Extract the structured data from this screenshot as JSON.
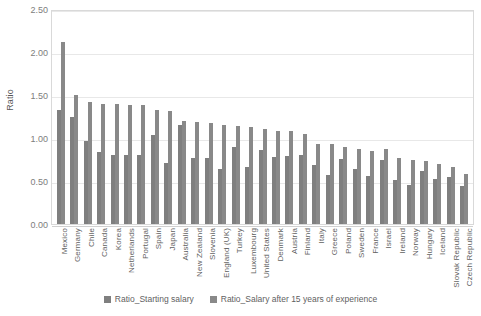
{
  "chart_data": {
    "type": "bar",
    "title": "",
    "xlabel": "",
    "ylabel": "Ratio",
    "ylim": [
      0.0,
      2.5
    ],
    "ytick_labels": [
      "0.00",
      "0.50",
      "1.00",
      "1.50",
      "2.00",
      "2.50"
    ],
    "ytick_values": [
      0.0,
      0.5,
      1.0,
      1.5,
      2.0,
      2.5
    ],
    "grid": true,
    "legend_position": "bottom",
    "categories": [
      "Mexico",
      "Germany",
      "Chile",
      "Canada",
      "Korea",
      "Netherlands",
      "Portugal",
      "Spain",
      "Japan",
      "Australia",
      "New Zealand",
      "Slovenia",
      "England (UK)",
      "Turkey",
      "Luxembourg",
      "United States",
      "Denmark",
      "Austria",
      "Finland",
      "Italy",
      "Greece",
      "Poland",
      "Sweden",
      "France",
      "Israel",
      "Ireland",
      "Norway",
      "Hungary",
      "Iceland",
      "Slovak Republic",
      "Czech Republic"
    ],
    "series": [
      {
        "name": "Ratio_Starting salary",
        "color": "#7f7f7f",
        "values": [
          1.33,
          1.25,
          0.97,
          0.84,
          0.8,
          0.8,
          0.8,
          1.03,
          0.71,
          1.15,
          0.77,
          0.77,
          0.64,
          0.9,
          0.66,
          0.86,
          0.78,
          0.79,
          0.8,
          0.69,
          0.57,
          0.76,
          0.64,
          0.56,
          0.74,
          0.51,
          0.45,
          0.62,
          0.52,
          0.55,
          0.44
        ]
      },
      {
        "name": "Ratio_Salary after 15 years of experience",
        "color": "#898989",
        "values": [
          2.12,
          1.5,
          1.42,
          1.4,
          1.39,
          1.38,
          1.38,
          1.33,
          1.31,
          1.2,
          1.19,
          1.17,
          1.15,
          1.14,
          1.13,
          1.1,
          1.08,
          1.08,
          1.05,
          0.93,
          0.93,
          0.89,
          0.87,
          0.85,
          0.87,
          0.77,
          0.75,
          0.73,
          0.7,
          0.66,
          0.58
        ]
      }
    ]
  }
}
